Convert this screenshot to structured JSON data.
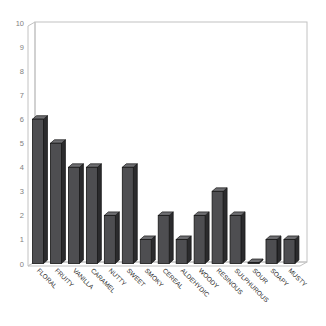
{
  "page": {
    "background": "#ffffff"
  },
  "chart_data": {
    "type": "bar",
    "style": "3d-column",
    "title": "",
    "xlabel": "",
    "ylabel": "",
    "categories": [
      "FLORAL",
      "FRUITY",
      "VANILLA",
      "CARAMEL",
      "NUTTY",
      "SWEET",
      "SMOKY",
      "CEREAL",
      "ALDEHYDIC",
      "WOODY",
      "RESINOUS",
      "SULPHUROUS",
      "SOUR",
      "SOAPY",
      "MUSTY"
    ],
    "values": [
      6,
      5,
      4,
      4,
      2,
      4,
      1,
      2,
      1,
      2,
      3,
      2,
      0,
      1,
      1
    ],
    "ylim": [
      0,
      10
    ],
    "ytick_step": 1,
    "grid": false,
    "legend": false,
    "colors": {
      "bar_front": "#4e4e51",
      "bar_top": "#6e6e71",
      "bar_side": "#2b2b2d",
      "bar_outline": "#161616",
      "wall_line": "#c2c2c2",
      "wall_fill": "#ffffff",
      "tick_label": "#7f7f7f",
      "category_label": "#2a2a2a",
      "background": "#ffffff"
    }
  }
}
